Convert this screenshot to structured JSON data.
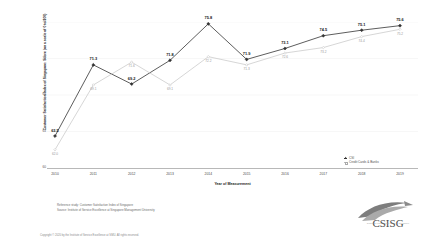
{
  "chart_data": {
    "type": "line",
    "title": "",
    "xlabel": "Year of Measurement",
    "ylabel": "Customer Satisfaction Index of Singapore: Score (on a scale of 0 to 100)",
    "categories": [
      "2010",
      "2011",
      "2012",
      "2013",
      "2014",
      "2015",
      "2016",
      "2017",
      "2018",
      "2019"
    ],
    "ylim": [
      60,
      76
    ],
    "yticks": [
      "60",
      "64",
      "68",
      "72",
      "76"
    ],
    "grid": false,
    "legend_position": "bottom-right",
    "series": [
      {
        "name": "CSI",
        "color": "#333333",
        "values": [
          63.5,
          71.3,
          69.2,
          71.8,
          75.8,
          71.9,
          73.1,
          74.5,
          75.1,
          75.6
        ],
        "labels": [
          "63.5",
          "71.3",
          "69.2",
          "71.8",
          "75.8",
          "71.9",
          "73.1",
          "74.5",
          "75.1",
          "75.6"
        ]
      },
      {
        "name": "Credit Cards & Banks",
        "color": "#c4c4c4",
        "values": [
          62.0,
          69.1,
          71.6,
          69.1,
          72.2,
          71.3,
          72.6,
          73.2,
          74.4,
          75.2
        ],
        "labels": [
          "62.0",
          "69.1",
          "71.6",
          "69.1",
          "72.2",
          "71.3",
          "72.6",
          "73.2",
          "74.4",
          "75.2"
        ]
      }
    ]
  },
  "footer": {
    "reference_line": "Reference study: Customer Satisfaction Index of Singapore",
    "source_line": "Source: Institute of Service Excellence at Singapore Management University",
    "copyright": "Copyright © 2020 by the Institute of Service Excellence at SMU. All rights reserved."
  },
  "logo": {
    "wordmark": "CSISG",
    "caption": "Customer Satisfaction Index of Singapore"
  }
}
